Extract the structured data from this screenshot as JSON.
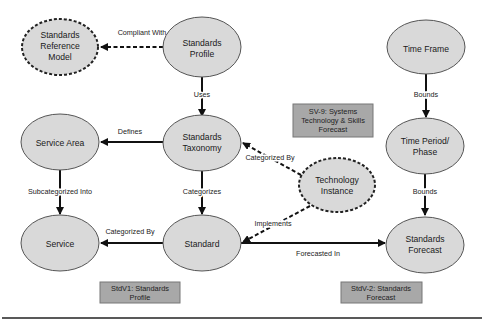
{
  "colors": {
    "node_fill": "#d9d9d9",
    "node_stroke": "#555555",
    "box_fill": "#a8a8a8",
    "box_stroke": "#777777",
    "edge": "#111111",
    "background": "#ffffff"
  },
  "nodes": {
    "standards_reference_model": {
      "lines": [
        "Standards",
        "Reference",
        "Model"
      ],
      "style": "dashed"
    },
    "standards_profile": {
      "lines": [
        "Standards",
        "Profile"
      ],
      "style": "solid"
    },
    "time_frame": {
      "lines": [
        "Time Frame"
      ],
      "style": "solid"
    },
    "service_area": {
      "lines": [
        "Service Area"
      ],
      "style": "solid"
    },
    "standards_taxonomy": {
      "lines": [
        "Standards",
        "Taxonomy"
      ],
      "style": "solid"
    },
    "time_period_phase": {
      "lines": [
        "Time Period/",
        "Phase"
      ],
      "style": "solid"
    },
    "technology_instance": {
      "lines": [
        "Technology",
        "Instance"
      ],
      "style": "dashed"
    },
    "service": {
      "lines": [
        "Service"
      ],
      "style": "solid"
    },
    "standard": {
      "lines": [
        "Standard"
      ],
      "style": "solid"
    },
    "standards_forecast": {
      "lines": [
        "Standards",
        "Forecast"
      ],
      "style": "solid"
    }
  },
  "edges": {
    "compliant_with": {
      "label": "Compliant With",
      "from": "Standards Profile",
      "to": "Standards Reference Model",
      "style": "dashed"
    },
    "uses": {
      "label": "Uses",
      "from": "Standards Profile",
      "to": "Standards Taxonomy",
      "style": "solid"
    },
    "bounds_1": {
      "label": "Bounds",
      "from": "Time Frame",
      "to": "Time Period/Phase",
      "style": "solid"
    },
    "defines": {
      "label": "Defines",
      "from": "Standards Taxonomy",
      "to": "Service Area",
      "style": "solid"
    },
    "subcategorized_into": {
      "label": "Subcategorized Into",
      "from": "Service Area",
      "to": "Service",
      "style": "solid"
    },
    "categorizes": {
      "label": "Categorizes",
      "from": "Standards Taxonomy",
      "to": "Standard",
      "style": "solid"
    },
    "categorized_by_taxonomy": {
      "label": "Categorized By",
      "from": "Technology Instance",
      "to": "Standards Taxonomy",
      "style": "dashed"
    },
    "implements": {
      "label": "Implements",
      "from": "Technology Instance",
      "to": "Standard",
      "style": "dashed"
    },
    "bounds_2": {
      "label": "Bounds",
      "from": "Time Period/Phase",
      "to": "Standards Forecast",
      "style": "solid"
    },
    "categorized_by_service": {
      "label": "Categorized By",
      "from": "Standard",
      "to": "Service",
      "style": "solid"
    },
    "forecasted_in": {
      "label": "Forecasted In",
      "from": "Standard",
      "to": "Standards Forecast",
      "style": "solid"
    }
  },
  "view_boxes": {
    "sv9": {
      "lines": [
        "SV-9: Systems",
        "Technology & Skills",
        "Forecast"
      ]
    },
    "stdv1": {
      "lines": [
        "StdV1: Standards",
        "Profile"
      ]
    },
    "stdv2": {
      "lines": [
        "StdV-2: Standards",
        "Forecast"
      ]
    }
  }
}
